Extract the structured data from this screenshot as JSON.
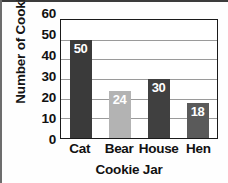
{
  "chart_data": {
    "type": "bar",
    "title": "",
    "xlabel": "Cookie Jar",
    "ylabel": "Number of Cookies",
    "categories": [
      "Cat",
      "Bear",
      "House",
      "Hen"
    ],
    "values": [
      50,
      24,
      30,
      18
    ],
    "value_labels": [
      "50",
      "24",
      "30",
      "18"
    ],
    "bar_colors": [
      "#3a3a3a",
      "#b3b3b3",
      "#404040",
      "#5a5a5a"
    ],
    "ylim": [
      0,
      60
    ],
    "yticks": [
      60,
      50,
      40,
      30,
      20,
      10,
      0
    ],
    "ytick_labels": [
      "60",
      "50",
      "40",
      "30",
      "20",
      "10",
      "0"
    ],
    "grid": true,
    "grid_color": "#9a9a9a",
    "legend": false,
    "data_label_color": "#ffffff",
    "frame_color": "#1a1a1a",
    "background": "#ffffff"
  }
}
